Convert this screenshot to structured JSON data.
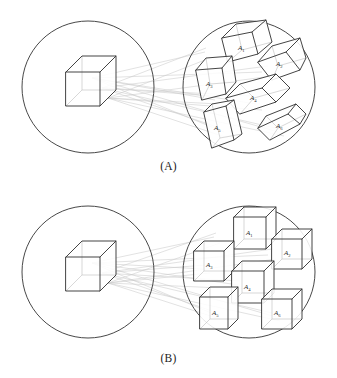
{
  "figure": {
    "background_color": "#ffffff",
    "stroke_color": "#3a3a3a",
    "circle_color": "#333333",
    "ray_color": "#c9c9c9",
    "width": 337,
    "height": 378
  },
  "panels": [
    {
      "id": "A",
      "caption": "(A)",
      "source": {
        "name": "source-domain-circle",
        "shape": "circle",
        "cube_count": 1,
        "cube_type": "cube",
        "cube_label": ""
      },
      "target": {
        "name": "target-domain-circle",
        "shape": "circle",
        "cube_count": 6,
        "cube_type": "parallelepiped",
        "labels": [
          "A1",
          "A2",
          "A3",
          "A4",
          "A5",
          "A6"
        ],
        "label_base": "A",
        "label_subscripts": [
          "1",
          "2",
          "3",
          "4",
          "5",
          "6"
        ]
      },
      "connector_count": 6
    },
    {
      "id": "B",
      "caption": "(B)",
      "source": {
        "name": "source-domain-circle",
        "shape": "circle",
        "cube_count": 1,
        "cube_type": "cube",
        "cube_label": ""
      },
      "target": {
        "name": "target-domain-circle",
        "shape": "circle",
        "cube_count": 6,
        "cube_type": "cube",
        "labels": [
          "A1",
          "A2",
          "A3",
          "A4",
          "A5",
          "A6"
        ],
        "label_base": "A",
        "label_subscripts": [
          "1",
          "2",
          "3",
          "4",
          "5",
          "6"
        ]
      },
      "connector_count": 6
    }
  ],
  "captions": {
    "panel_a": "(A)",
    "panel_b": "(B)"
  },
  "labels": {
    "base": "A",
    "subscripts": [
      "1",
      "2",
      "3",
      "4",
      "5",
      "6"
    ],
    "a1": "A",
    "a1_sub": "1",
    "a2": "A",
    "a2_sub": "2",
    "a3": "A",
    "a3_sub": "3",
    "a4": "A",
    "a4_sub": "4",
    "a5": "A",
    "a5_sub": "5",
    "a6": "A",
    "a6_sub": "6"
  }
}
